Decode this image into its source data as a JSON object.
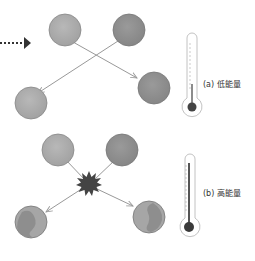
{
  "diagram": {
    "panels": [
      {
        "id": "a",
        "label": "(a) 低能量",
        "description": "low energy collision: particles bounce off, unchanged",
        "thermometer_level": "low"
      },
      {
        "id": "b",
        "label": "(b) 高能量",
        "description": "high energy collision: particles collide with burst and become altered",
        "thermometer_level": "high"
      }
    ],
    "colors": {
      "particle_light": "#aaaaaa",
      "particle_dark": "#8e8e8e",
      "arrow": "#999999",
      "burst": "#444444",
      "thermometer_outline": "#bbbbbb",
      "mercury": "#555555",
      "pointer_arrow": "#333333"
    }
  }
}
